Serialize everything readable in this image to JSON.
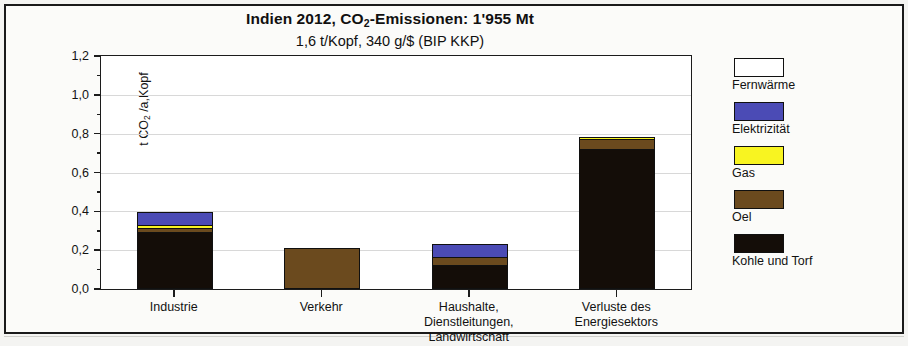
{
  "chart_data": {
    "type": "bar",
    "stacked": true,
    "title_prefix": "Indien 2012, CO",
    "title_sub": "2",
    "title_suffix": "-Emissionen:  1'955 Mt",
    "title": "Indien 2012, CO2-Emissionen: 1'955 Mt",
    "subtitle": "1,6 t/Kopf,    340 g/$  (BIP KKP)",
    "ylabel_prefix": "t CO",
    "ylabel_sub": "2",
    "ylabel_suffix": " /a,Kopf",
    "ylabel": "t CO2 /a,Kopf",
    "xlabel": "",
    "ylim": [
      0,
      1.2
    ],
    "yticks": [
      "0,0",
      "0,2",
      "0,4",
      "0,6",
      "0,8",
      "1,0",
      "1,2"
    ],
    "ytick_values": [
      0.0,
      0.2,
      0.4,
      0.6,
      0.8,
      1.0,
      1.2
    ],
    "grid": true,
    "legend_position": "right",
    "categories": [
      "Industrie",
      "Verkehr",
      "Haushalte,\nDienstleitungen,\nLandwirtschaft",
      "Verluste des\nEnergiesektors"
    ],
    "category_lines": [
      [
        "Industrie"
      ],
      [
        "Verkehr"
      ],
      [
        "Haushalte,",
        "Dienstleitungen,",
        "Landwirtschaft"
      ],
      [
        "Verluste des",
        "Energiesektors"
      ]
    ],
    "series": [
      {
        "name": "Kohle und Torf",
        "color": "#140d08",
        "values": [
          0.294,
          0.0,
          0.125,
          0.727
        ]
      },
      {
        "name": "Oel",
        "color": "#6b4a1e",
        "values": [
          0.021,
          0.212,
          0.04,
          0.053
        ]
      },
      {
        "name": "Gas",
        "color": "#f8f421",
        "values": [
          0.02,
          0.0,
          0.0,
          0.005
        ]
      },
      {
        "name": "Elektrizität",
        "color": "#4b4bb5",
        "values": [
          0.062,
          0.0,
          0.065,
          0.0
        ]
      },
      {
        "name": "Fernwärme",
        "color": "#ffffff",
        "values": [
          0.0,
          0.0,
          0.0,
          0.0
        ]
      }
    ],
    "totals": [
      0.397,
      0.212,
      0.23,
      0.785
    ]
  },
  "legend": {
    "items": [
      {
        "label": "Fernwärme",
        "color": "#ffffff"
      },
      {
        "label": "Elektrizität",
        "color": "#4b4bb5"
      },
      {
        "label": "Gas",
        "color": "#f8f421"
      },
      {
        "label": "Oel",
        "color": "#6b4a1e"
      },
      {
        "label": "Kohle und Torf",
        "color": "#140d08"
      }
    ]
  }
}
